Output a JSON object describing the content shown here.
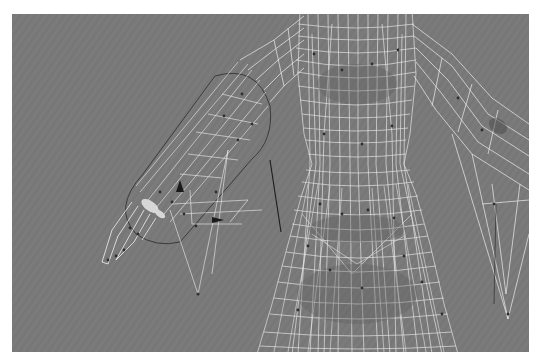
{
  "viewport": {
    "label": "3D wireframe viewport",
    "background_color": "#7b7b7b",
    "wire_color": "#f2f2f2",
    "vertex_color": "#2e2e2e",
    "bone_color": "#1e1e1e"
  },
  "scene": {
    "objects": [
      {
        "name": "character-mesh",
        "type": "wireframe-mesh"
      },
      {
        "name": "left-arm-capsule",
        "type": "capsule-envelope"
      },
      {
        "name": "right-arm",
        "type": "wireframe-mesh"
      },
      {
        "name": "skirt",
        "type": "wireframe-mesh"
      },
      {
        "name": "bone-line",
        "type": "helper"
      }
    ]
  }
}
